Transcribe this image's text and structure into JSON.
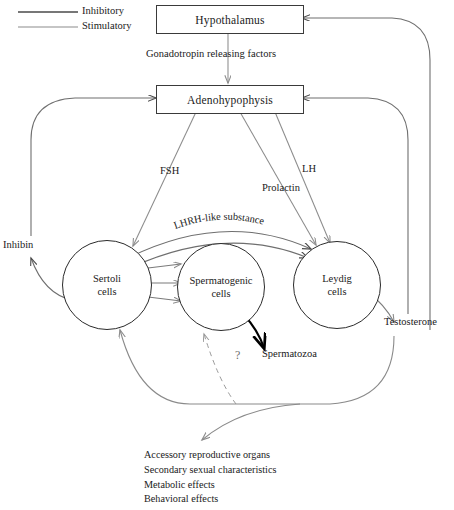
{
  "diagram": {
    "title_nodes": {
      "hypothalamus": "Hypothalamus",
      "adenohypophysis": "Adenohypophysis"
    },
    "legend": [
      {
        "key": "inhibitory",
        "label": "Inhibitory",
        "color": "#4a4a4a",
        "width": 1.6
      },
      {
        "key": "stimulatory",
        "label": "Stimulatory",
        "color": "#8c8c8c",
        "width": 1.1
      }
    ],
    "edge_labels": {
      "gnrh": "Gonadotropin releasing factors",
      "fsh": "FSH",
      "lh": "LH",
      "prolactin": "Prolactin",
      "lhrh_like": "LHRH-like substance",
      "inhibin": "Inhibin",
      "testosterone": "Testosterone",
      "spermatozoa": "Spermatozoa",
      "question": "?"
    },
    "cells": [
      {
        "key": "sertoli",
        "line1": "Sertoli",
        "line2": "cells"
      },
      {
        "key": "spermatogenic",
        "line1": "Spermatogenic",
        "line2": "cells"
      },
      {
        "key": "leydig",
        "line1": "Leydig",
        "line2": "cells"
      }
    ],
    "effects": [
      "Accessory reproductive organs",
      "Secondary sexual characteristics",
      "Metabolic effects",
      "Behavioral effects"
    ]
  }
}
